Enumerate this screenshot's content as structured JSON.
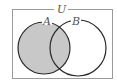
{
  "diagram": {
    "type": "venn",
    "universe_label": "U",
    "sets": [
      {
        "label": "A",
        "shaded": true
      },
      {
        "label": "B",
        "shaded": false
      }
    ],
    "shaded_region": "A",
    "colors": {
      "shade": "#c8c8c8",
      "stroke": "#2a2a2a",
      "frame": "#9a9a9a",
      "background": "#ffffff"
    }
  }
}
